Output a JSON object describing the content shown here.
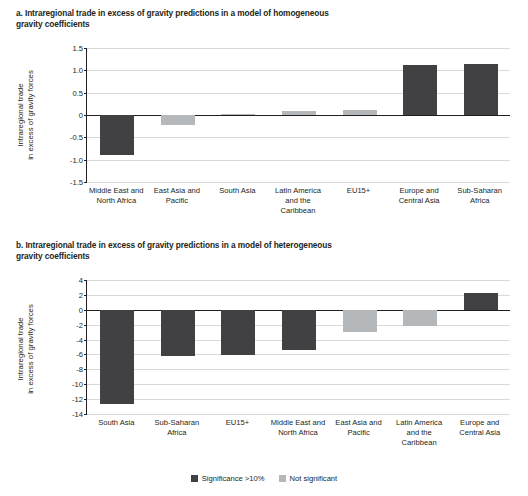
{
  "panels": {
    "a": {
      "title": "a. Intraregional trade in excess of gravity predictions in a model of homogeneous gravity coefficients",
      "ylabel": "Intraregional trade\nin excess of gravity forces"
    },
    "b": {
      "title": "b. Intraregional trade in excess of gravity predictions in a model of heterogeneous gravity coefficients",
      "ylabel": "Intraregional trade\nin excess of gravity forces"
    }
  },
  "legend": {
    "items": [
      {
        "label": "Significance >10%",
        "color": "#414042"
      },
      {
        "label": "Not significant",
        "color": "#b5b8ba"
      }
    ]
  },
  "chart_data": [
    {
      "type": "bar",
      "title": "a. Intraregional trade in excess of gravity predictions in a model of homogeneous gravity coefficients",
      "xlabel": "",
      "ylabel": "Intraregional trade in excess of gravity forces",
      "ylim": [
        -1.5,
        1.5
      ],
      "yticks": [
        -1.5,
        -1.0,
        -0.5,
        0.0,
        0.5,
        1.0,
        1.5
      ],
      "ytick_labels": [
        "-1.5",
        "-1.0",
        "-0.5",
        "0",
        "0.5",
        "1.0",
        "1.5"
      ],
      "grid": true,
      "categories": [
        "Middle East and North Africa",
        "East Asia and Pacific",
        "South Asia",
        "Latin America and the Caribbean",
        "EU15+",
        "Europe and Central Asia",
        "Sub-Saharan Africa"
      ],
      "values": [
        -0.89,
        -0.22,
        0.03,
        0.09,
        0.12,
        1.11,
        1.15
      ],
      "significance": [
        "Significance >10%",
        "Not significant",
        "Not significant",
        "Not significant",
        "Not significant",
        "Significance >10%",
        "Significance >10%"
      ]
    },
    {
      "type": "bar",
      "title": "b. Intraregional trade in excess of gravity predictions in a model of heterogeneous gravity coefficients",
      "xlabel": "",
      "ylabel": "Intraregional trade in excess of gravity forces",
      "ylim": [
        -14,
        4
      ],
      "yticks": [
        -14,
        -12,
        -10,
        -8,
        -6,
        -4,
        -2,
        0,
        2,
        4
      ],
      "ytick_labels": [
        "-14",
        "-12",
        "-10",
        "-8",
        "-6",
        "-4",
        "-2",
        "0",
        "2",
        "4"
      ],
      "grid": true,
      "categories": [
        "South Asia",
        "Sub-Saharan Africa",
        "EU15+",
        "Middle East and North Africa",
        "East Asia and Pacific",
        "Latin America and the Caribbean",
        "Europe and Central Asia"
      ],
      "values": [
        -12.7,
        -6.2,
        -6.1,
        -5.4,
        -3.0,
        -2.2,
        2.3
      ],
      "significance": [
        "Significance >10%",
        "Significance >10%",
        "Significance >10%",
        "Significance >10%",
        "Not significant",
        "Not significant",
        "Significance >10%"
      ]
    }
  ]
}
